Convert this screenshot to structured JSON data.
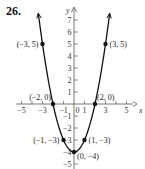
{
  "problem_number": "26.",
  "chart_data": {
    "type": "line",
    "title": "",
    "function": "y = x^2 - 4",
    "xlabel": "x",
    "ylabel": "y",
    "xlim": [
      -5.5,
      6
    ],
    "ylim": [
      -5.5,
      8
    ],
    "x_tick_labels": [
      "-5",
      "-3",
      "-1",
      "1",
      "3",
      "5"
    ],
    "x_ticks": [
      -5,
      -4,
      -3,
      -2,
      -1,
      1,
      2,
      3,
      4,
      5
    ],
    "y_tick_labels": [
      "7",
      "6",
      "5",
      "4",
      "3",
      "2",
      "1",
      "-1",
      "-2",
      "-3",
      "-4",
      "-5"
    ],
    "y_ticks": [
      7,
      6,
      5,
      4,
      3,
      2,
      1,
      -1,
      -2,
      -3,
      -4,
      -5
    ],
    "grid": false,
    "points": [
      {
        "x": -3,
        "y": 5,
        "label": "(−3, 5)"
      },
      {
        "x": 3,
        "y": 5,
        "label": "(3, 5)"
      },
      {
        "x": -2,
        "y": 0,
        "label": "(−2, 0)"
      },
      {
        "x": 2,
        "y": 0,
        "label": "(2, 0)"
      },
      {
        "x": -1,
        "y": -3,
        "label": "(−1, −3)"
      },
      {
        "x": 1,
        "y": -3,
        "label": "(1, −3)"
      },
      {
        "x": 0,
        "y": -4,
        "label": "(0, −4)"
      }
    ],
    "series": [
      {
        "name": "parabola",
        "x": [
          -3.4,
          -3,
          -2,
          -1,
          0,
          1,
          2,
          3,
          3.4
        ],
        "y": [
          7.56,
          5,
          0,
          -3,
          -4,
          -3,
          0,
          5,
          7.56
        ]
      }
    ]
  }
}
